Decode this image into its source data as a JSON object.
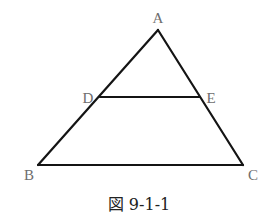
{
  "diagram": {
    "type": "geometry-triangle",
    "colors": {
      "line": "#141414",
      "label": "#6e6e6e",
      "caption": "#222222",
      "background": "#ffffff"
    },
    "points": {
      "A": {
        "label": "A",
        "x": 158,
        "y": 30
      },
      "B": {
        "label": "B",
        "x": 38,
        "y": 165
      },
      "C": {
        "label": "C",
        "x": 243,
        "y": 165
      },
      "D": {
        "label": "D",
        "x": 100,
        "y": 97
      },
      "E": {
        "label": "E",
        "x": 200,
        "y": 97
      }
    },
    "segments": [
      {
        "name": "AB",
        "from": "A",
        "to": "B"
      },
      {
        "name": "AC",
        "from": "A",
        "to": "C"
      },
      {
        "name": "BC",
        "from": "B",
        "to": "C"
      },
      {
        "name": "DE",
        "from": "D",
        "to": "E"
      }
    ],
    "caption": "図 9-1-1"
  }
}
